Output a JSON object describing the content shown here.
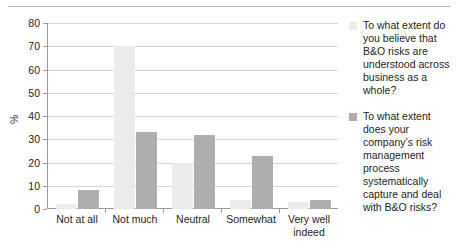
{
  "chart_data": {
    "type": "bar",
    "title": "",
    "subtitle": "",
    "xlabel": "",
    "ylabel": "%",
    "ylim": [
      0,
      80
    ],
    "yticks": [
      0,
      10,
      20,
      30,
      40,
      50,
      60,
      70,
      80
    ],
    "grid": true,
    "legend_position": "right",
    "categories": [
      "Not at all",
      "Not much",
      "Neutral",
      "Somewhat",
      "Very well indeed"
    ],
    "series": [
      {
        "name": "To what extent do you believe that B&O risks are understood across business as a whole?",
        "color": "#ebebeb",
        "values": [
          2,
          70,
          20,
          4,
          3
        ]
      },
      {
        "name": "To what extent does your company’s risk management process systematically capture and deal with B&O risks?",
        "color": "#aeaeae",
        "values": [
          8,
          33,
          32,
          23,
          4
        ]
      }
    ]
  },
  "axis": {
    "y_title": "%",
    "tick_labels": [
      "80",
      "70",
      "60",
      "50",
      "40",
      "30",
      "20",
      "10",
      "0"
    ]
  },
  "legend": {
    "entries": [
      {
        "swatch_color": "#ebebeb",
        "label": "To what extent do you believe that B&O risks are understood across business as a whole?"
      },
      {
        "swatch_color": "#aeaeae",
        "label": "To what extent does your company’s risk management process systematically capture and deal with B&O risks?"
      }
    ]
  }
}
